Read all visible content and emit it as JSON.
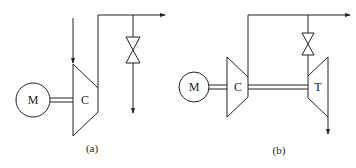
{
  "diagram_a": {
    "caption": "(a)",
    "motor_label": "M",
    "compressor_label": "C",
    "components": [
      "motor",
      "shaft",
      "compressor",
      "inlet-arrow",
      "outlet-pipe",
      "throttle-valve",
      "outlet-arrow",
      "bleed-arrow"
    ]
  },
  "diagram_b": {
    "caption": "(b)",
    "motor_label": "M",
    "compressor_label": "C",
    "turbine_label": "T",
    "components": [
      "motor",
      "shaft-motor-compressor",
      "compressor",
      "outlet-pipe",
      "throttle-valve",
      "turbine",
      "shaft-compressor-turbine",
      "outlet-arrow",
      "turbine-exhaust-arrow"
    ]
  },
  "colors": {
    "line": "#222222",
    "background": "#ffffff"
  }
}
